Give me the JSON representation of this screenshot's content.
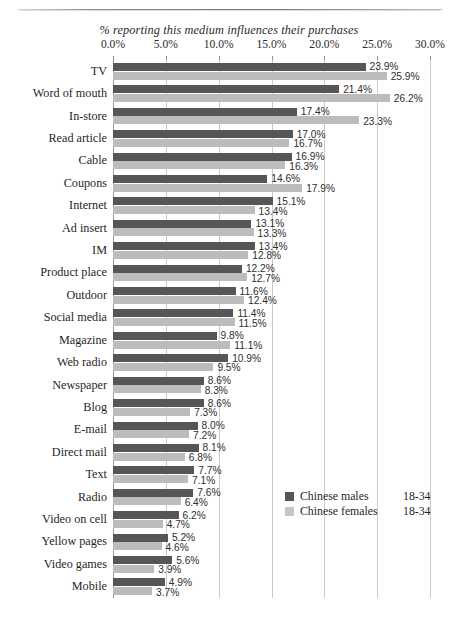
{
  "chart_data": {
    "type": "bar",
    "orientation": "horizontal",
    "title": "% reporting this medium influences their purchases",
    "xlabel": "",
    "ylabel": "",
    "xlim": [
      0,
      30
    ],
    "xticks": [
      "0.0%",
      "5.0%",
      "10.0%",
      "15.0%",
      "20.0%",
      "25.0%",
      "30.0%"
    ],
    "xtick_values": [
      0,
      5,
      10,
      15,
      20,
      25,
      30
    ],
    "grid": true,
    "legend_position": "center-right-inside",
    "categories": [
      "TV",
      "Word of mouth",
      "In-store",
      "Read article",
      "Cable",
      "Coupons",
      "Internet",
      "Ad insert",
      "IM",
      "Product place",
      "Outdoor",
      "Social media",
      "Magazine",
      "Web radio",
      "Newspaper",
      "Blog",
      "E-mail",
      "Direct mail",
      "Text",
      "Radio",
      "Video on cell",
      "Yellow pages",
      "Video games",
      "Mobile"
    ],
    "series": [
      {
        "name": "Chinese males",
        "age_range": "18-34",
        "color": "#565656",
        "values": [
          23.9,
          21.4,
          17.4,
          17.0,
          16.9,
          14.6,
          15.1,
          13.1,
          13.4,
          12.2,
          11.6,
          11.4,
          9.8,
          10.9,
          8.6,
          8.6,
          8.0,
          8.1,
          7.7,
          7.6,
          6.2,
          5.2,
          5.6,
          4.9
        ],
        "labels": [
          "23.9%",
          "21.4%",
          "17.4%",
          "17.0%",
          "16.9%",
          "14.6%",
          "15.1%",
          "13.1%",
          "13.4%",
          "12.2%",
          "11.6%",
          "11.4%",
          "9.8%",
          "10.9%",
          "8.6%",
          "8.6%",
          "8.0%",
          "8.1%",
          "7.7%",
          "7.6%",
          "6.2%",
          "5.2%",
          "5.6%",
          "4.9%"
        ]
      },
      {
        "name": "Chinese females",
        "age_range": "18-34",
        "color": "#bcbcbc",
        "values": [
          25.9,
          26.2,
          23.3,
          16.7,
          16.3,
          17.9,
          13.4,
          13.3,
          12.8,
          12.7,
          12.4,
          11.5,
          11.1,
          9.5,
          8.3,
          7.3,
          7.2,
          6.8,
          7.1,
          6.4,
          4.7,
          4.6,
          3.9,
          3.7
        ],
        "labels": [
          "25.9%",
          "26.2%",
          "23.3%",
          "16.7%",
          "16.3%",
          "17.9%",
          "13.4%",
          "13.3%",
          "12.8%",
          "12.7%",
          "12.4%",
          "11.5%",
          "11.1%",
          "9.5%",
          "8.3%",
          "7.3%",
          "7.2%",
          "6.8%",
          "7.1%",
          "6.4%",
          "4.7%",
          "4.6%",
          "3.9%",
          "3.7%"
        ]
      }
    ]
  },
  "legend": {
    "items": [
      {
        "label": "Chinese males",
        "range": "18-34"
      },
      {
        "label": "Chinese females",
        "range": "18-34"
      }
    ]
  },
  "colors": {
    "males": "#565656",
    "females": "#bcbcbc",
    "gridline": "#c9c9c9",
    "axis": "#9a9a9a",
    "text": "#1f1f1f"
  }
}
